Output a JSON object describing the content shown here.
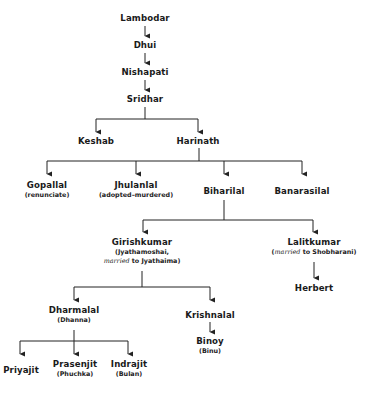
{
  "diagram": {
    "type": "family-tree",
    "nodes": {
      "lambodar": {
        "name": "Lambodar"
      },
      "dhui": {
        "name": "Dhui"
      },
      "nishapati": {
        "name": "Nishapati"
      },
      "sridhar": {
        "name": "Sridhar"
      },
      "keshab": {
        "name": "Keshab"
      },
      "harinath": {
        "name": "Harinath"
      },
      "gopallal": {
        "name": "Gopallal",
        "note": "(renunciate)"
      },
      "jhulanlal": {
        "name": "Jhulanlal",
        "note": "(adopted–murdered)"
      },
      "biharilal": {
        "name": "Biharilal"
      },
      "banarasilal": {
        "name": "Banarasilal"
      },
      "girishkumar": {
        "name": "Girishkumar",
        "note_line1": "(Jyathamoshai,",
        "note_line2_italic": "married",
        "note_line2_rest": " to Jyathaima)"
      },
      "lalitkumar": {
        "name": "Lalitkumar",
        "note_open": "(",
        "note_italic": "married",
        "note_rest": " to Shobharani)"
      },
      "herbert": {
        "name": "Herbert"
      },
      "dharmalal": {
        "name": "Dharmalal",
        "note": "(Dhanna)"
      },
      "krishnalal": {
        "name": "Krishnalal"
      },
      "binoy": {
        "name": "Binoy",
        "note": "(Binu)"
      },
      "priyajit": {
        "name": "Priyajit"
      },
      "prasenjit": {
        "name": "Prasenjit",
        "note": "(Phuchka)"
      },
      "indrajit": {
        "name": "Indrajit",
        "note": "(Bulan)"
      }
    },
    "edges": [
      [
        "lambodar",
        "dhui"
      ],
      [
        "dhui",
        "nishapati"
      ],
      [
        "nishapati",
        "sridhar"
      ],
      [
        "sridhar",
        "keshab"
      ],
      [
        "sridhar",
        "harinath"
      ],
      [
        "harinath",
        "gopallal"
      ],
      [
        "harinath",
        "jhulanlal"
      ],
      [
        "harinath",
        "biharilal"
      ],
      [
        "harinath",
        "banarasilal"
      ],
      [
        "biharilal",
        "girishkumar"
      ],
      [
        "biharilal",
        "lalitkumar"
      ],
      [
        "lalitkumar",
        "herbert"
      ],
      [
        "girishkumar",
        "dharmalal"
      ],
      [
        "girishkumar",
        "krishnalal"
      ],
      [
        "krishnalal",
        "binoy"
      ],
      [
        "dharmalal",
        "priyajit"
      ],
      [
        "dharmalal",
        "prasenjit"
      ],
      [
        "dharmalal",
        "indrajit"
      ]
    ],
    "line_color": "#222222"
  }
}
